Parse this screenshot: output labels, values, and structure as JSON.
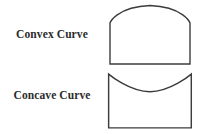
{
  "diagram": {
    "background_color": "#ffffff",
    "stroke_color": "#3c3c3c",
    "text_color": "#2b2b2b",
    "rows": [
      {
        "id": "convex",
        "label": "Convex Curve",
        "shape_name": "rectangle-with-convex-arched-top",
        "curve_type": "convex",
        "description": "Rectangle whose top edge bulges upward into a dome"
      },
      {
        "id": "concave",
        "label": "Concave Curve",
        "shape_name": "rectangle-with-concave-dished-top",
        "curve_type": "concave",
        "description": "Rectangle whose top edge dips downward into a dish"
      }
    ]
  },
  "shapes": {
    "convex": {
      "path": "M 4 64 L 4 23 C 4 23 10 7 44 5.5 C 78 7 84 23 84 23 L 84 64 Z",
      "viewbox": "0 0 90 70"
    },
    "concave": {
      "path": "M 4 56 L 4 4 C 4 4 24 21 44 21 C 64 21 84 4 84 4 L 84 56 Z",
      "viewbox": "0 0 90 60"
    }
  }
}
